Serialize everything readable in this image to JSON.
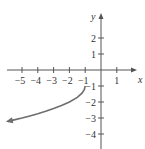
{
  "chart_data": {
    "type": "line",
    "title": "",
    "xlabel": "x",
    "ylabel": "y",
    "xlim": [
      -6,
      2
    ],
    "ylim": [
      -4.5,
      3
    ],
    "grid": false,
    "x_ticks": [
      -5,
      -4,
      -3,
      -2,
      -1,
      1
    ],
    "x_tick_labels": [
      "−5",
      "−4",
      "−3",
      "−2",
      "−1",
      "1"
    ],
    "y_ticks": [
      2,
      1,
      -1,
      -2,
      -3,
      -4
    ],
    "y_tick_labels": [
      "2",
      "1",
      "−1",
      "−2",
      "−3",
      "−4"
    ],
    "series": [
      {
        "name": "curve",
        "color": "#6e6e6e",
        "start_point": [
          -1,
          -1
        ],
        "end_arrow": true,
        "x": [
          -1,
          -1.05,
          -1.2,
          -1.5,
          -2,
          -2.5,
          -3,
          -3.5,
          -4,
          -4.5,
          -5,
          -5.5,
          -5.9
        ],
        "y": [
          -1,
          -1.22,
          -1.45,
          -1.71,
          -2.0,
          -2.22,
          -2.41,
          -2.58,
          -2.73,
          -2.87,
          -3.0,
          -3.12,
          -3.21
        ]
      }
    ],
    "axis_color": "#555555"
  }
}
